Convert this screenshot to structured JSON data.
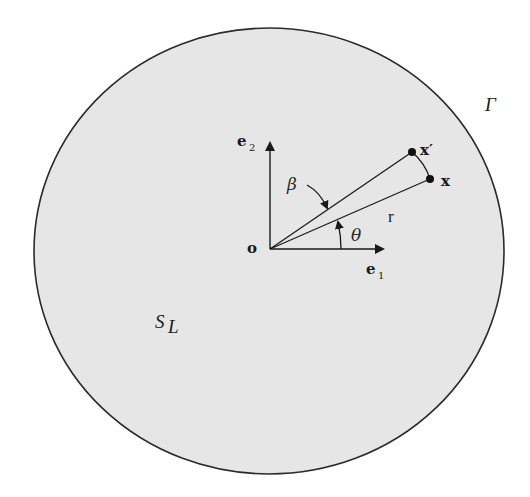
{
  "diagram": {
    "colors": {
      "background": "#ffffff",
      "domain_fill": "#e6e6e6",
      "stroke": "#2b2b2b"
    },
    "labels": {
      "boundary": "Γ",
      "domain": "S",
      "domain_sub": "L",
      "origin": "o",
      "e1": "e",
      "e1_sub": "1",
      "e2": "e",
      "e2_sub": "2",
      "point_x": "x",
      "point_x_prime": "x′",
      "radius": "r",
      "angle_theta": "θ",
      "angle_beta": "β"
    }
  }
}
